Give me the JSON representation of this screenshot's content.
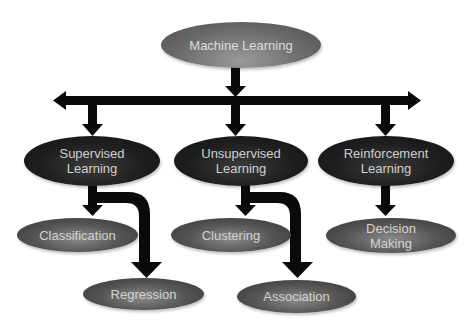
{
  "diagram": {
    "type": "hierarchy",
    "root": {
      "label": "Machine Learning"
    },
    "categories": [
      {
        "line1": "Supervised",
        "line2": "Learning",
        "children": [
          {
            "line1": "Classification",
            "line2": ""
          },
          {
            "line1": "Regression",
            "line2": ""
          }
        ]
      },
      {
        "line1": "Unsupervised",
        "line2": "Learning",
        "children": [
          {
            "line1": "Clustering",
            "line2": ""
          },
          {
            "line1": "Association",
            "line2": ""
          }
        ]
      },
      {
        "line1": "Reinforcement",
        "line2": "Learning",
        "children": [
          {
            "line1": "Decision",
            "line2": "Making"
          }
        ]
      }
    ],
    "colors": {
      "arrow": "#0a0a0a",
      "root_fill": "#6c6c6c",
      "category_fill": "#1e1e1e",
      "leaf_fill": "#555555",
      "text": "#d6d6d6",
      "background": "#ffffff"
    }
  }
}
